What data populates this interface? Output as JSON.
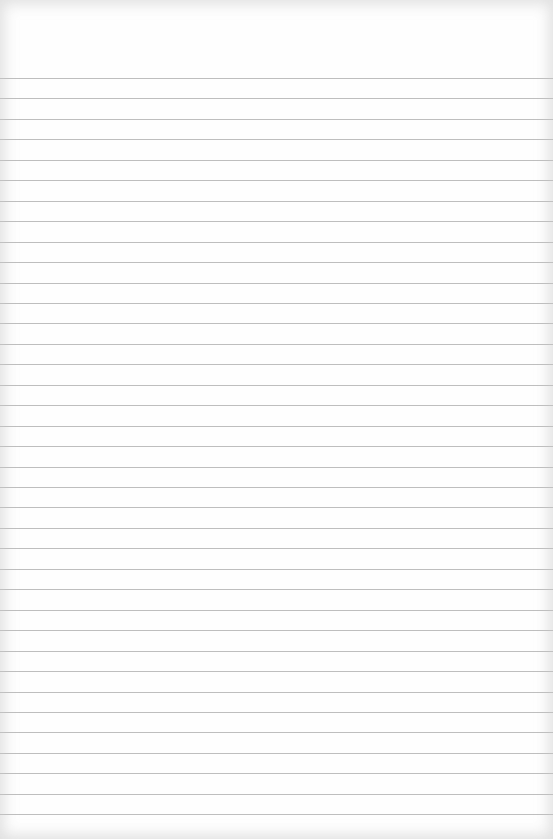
{
  "page": {
    "type": "blank lined paper",
    "text": "",
    "line_color": "#b3b3b3",
    "paper_color": "#fefefe",
    "first_line_y": 78,
    "line_spacing": 20.45,
    "line_count": 37
  }
}
